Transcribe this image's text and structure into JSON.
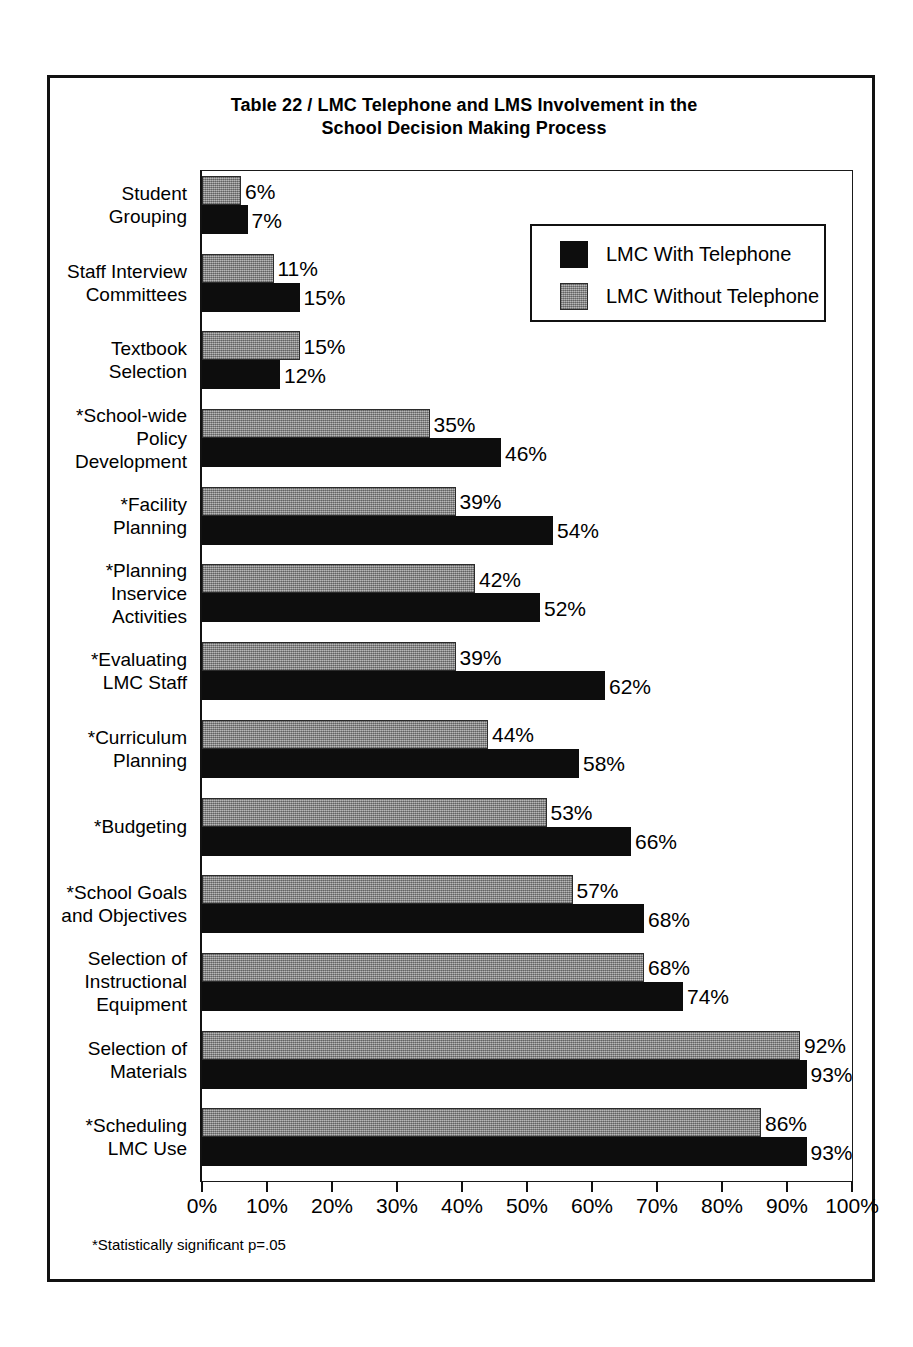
{
  "figure": {
    "title_line_1": "Table 22  /  LMC Telephone and LMS Involvement in the",
    "title_line_2": "School Decision Making Process",
    "footnote": "*Statistically significant p=.05"
  },
  "legend": {
    "entries": [
      {
        "label": "LMC With Telephone",
        "swatch": "black",
        "color": "#0d0d0d"
      },
      {
        "label": "LMC Without Telephone",
        "swatch": "gray",
        "color": "#9a9a9a"
      }
    ]
  },
  "axis": {
    "tick_labels": [
      "0%",
      "10%",
      "20%",
      "30%",
      "40%",
      "50%",
      "60%",
      "70%",
      "80%",
      "90%",
      "100%"
    ]
  },
  "chart_data": {
    "type": "bar",
    "orientation": "horizontal",
    "title": "Table 22  /  LMC Telephone and LMS Involvement in the School Decision Making Process",
    "xlabel": "",
    "ylabel": "",
    "xlim": [
      0,
      100
    ],
    "xticks": [
      0,
      10,
      20,
      30,
      40,
      50,
      60,
      70,
      80,
      90,
      100
    ],
    "xtick_labels": [
      "0%",
      "10%",
      "20%",
      "30%",
      "40%",
      "50%",
      "60%",
      "70%",
      "80%",
      "90%",
      "100%"
    ],
    "grid": false,
    "legend_position": "upper-right-inside",
    "annotation": "*Statistically significant p=.05",
    "value_suffix": "%",
    "categories": [
      "Student Grouping",
      "Staff Interview Committees",
      "Textbook Selection",
      "*School-wide Policy Development",
      "*Facility Planning",
      "*Planning Inservice Activities",
      "*Evaluating LMC Staff",
      "*Curriculum Planning",
      "*Budgeting",
      "*School Goals and Objectives",
      "Selection of Instructional Equipment",
      "Selection of Materials",
      "*Scheduling LMC Use"
    ],
    "series": [
      {
        "name": "LMC Without Telephone",
        "color": "#9a9a9a",
        "values": [
          6,
          11,
          15,
          35,
          39,
          42,
          39,
          44,
          53,
          57,
          68,
          92,
          86
        ]
      },
      {
        "name": "LMC With Telephone",
        "color": "#0d0d0d",
        "values": [
          7,
          15,
          12,
          46,
          54,
          52,
          62,
          58,
          66,
          68,
          74,
          93,
          93
        ]
      }
    ]
  },
  "category_label_lines": [
    [
      "Student",
      "Grouping"
    ],
    [
      "Staff Interview",
      "Committees"
    ],
    [
      "Textbook",
      "Selection"
    ],
    [
      "*School-wide",
      "Policy",
      "Development"
    ],
    [
      "*Facility",
      "Planning"
    ],
    [
      "*Planning",
      "Inservice",
      "Activities"
    ],
    [
      "*Evaluating",
      "LMC Staff"
    ],
    [
      "*Curriculum",
      "Planning"
    ],
    [
      "*Budgeting"
    ],
    [
      "*School Goals",
      "and Objectives"
    ],
    [
      "Selection of",
      "Instructional",
      "Equipment"
    ],
    [
      "Selection of",
      "Materials"
    ],
    [
      "*Scheduling",
      "LMC Use"
    ]
  ]
}
